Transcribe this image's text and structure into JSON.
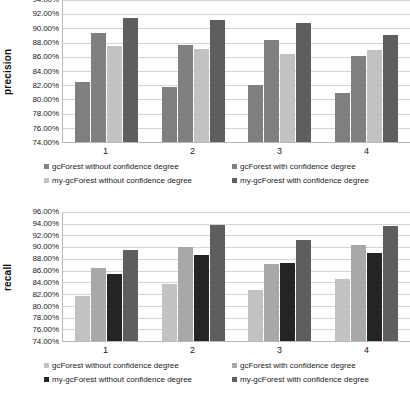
{
  "figure": {
    "charts": [
      {
        "name": "precision-chart",
        "ylabel": "precision",
        "xlabel": "",
        "type": "bar",
        "categories": [
          "1",
          "2",
          "3",
          "4"
        ],
        "ymin": 74.0,
        "ymax": 94.0,
        "ystep": 2.0,
        "yticks": [
          "74.00%",
          "76.00%",
          "78.00%",
          "80.00%",
          "82.00%",
          "84.00%",
          "86.00%",
          "88.00%",
          "90.00%",
          "92.00%",
          "94.00%"
        ],
        "grid": true,
        "legend_position": "bottom",
        "series": [
          {
            "name": "gcForest without confidence degree",
            "color": "#7f7f7f",
            "values": [
              82.4,
              81.8,
              82.1,
              80.9
            ]
          },
          {
            "name": "gcForest with confidence degree",
            "color": "#808080",
            "values": [
              89.4,
              87.6,
              88.4,
              86.1
            ]
          },
          {
            "name": "my-gcForest without confidence degree",
            "color": "#c2c2c2",
            "values": [
              87.5,
              87.1,
              86.4,
              86.9
            ]
          },
          {
            "name": "my-gcForest with confidence degree",
            "color": "#5e5e5e",
            "values": [
              91.5,
              91.2,
              90.7,
              89.1
            ]
          }
        ]
      },
      {
        "name": "recall-chart",
        "ylabel": "recall",
        "xlabel": "",
        "type": "bar",
        "categories": [
          "1",
          "2",
          "3",
          "4"
        ],
        "ymin": 74.0,
        "ymax": 96.0,
        "ystep": 2.0,
        "yticks": [
          "74.00%",
          "76.00%",
          "78.00%",
          "80.00%",
          "82.00%",
          "84.00%",
          "86.00%",
          "88.00%",
          "90.00%",
          "92.00%",
          "94.00%",
          "96.00%"
        ],
        "grid": true,
        "legend_position": "bottom",
        "series": [
          {
            "name": "gcForest without confidence degree",
            "color": "#c2c2c2",
            "values": [
              81.6,
              83.8,
              82.7,
              84.5
            ]
          },
          {
            "name": "gcForest with confidence degree",
            "color": "#a8a8a8",
            "values": [
              86.5,
              90.0,
              87.2,
              90.4
            ]
          },
          {
            "name": "my-gcForest without confidence degree",
            "color": "#242424",
            "values": [
              85.5,
              88.6,
              87.3,
              89.0
            ]
          },
          {
            "name": "my-gcForest with confidence degree",
            "color": "#5e5e5e",
            "values": [
              89.5,
              93.8,
              91.3,
              93.7
            ]
          }
        ]
      }
    ]
  },
  "chart_data": [
    {
      "type": "bar",
      "title": "",
      "xlabel": "",
      "ylabel": "precision",
      "categories": [
        "1",
        "2",
        "3",
        "4"
      ],
      "ylim": [
        74.0,
        96.0
      ],
      "yticks": [
        74.0,
        76.0,
        78.0,
        80.0,
        82.0,
        84.0,
        86.0,
        88.0,
        90.0,
        92.0,
        94.0
      ],
      "ytick_labels": [
        "74.00%",
        "76.00%",
        "78.00%",
        "80.00%",
        "82.00%",
        "84.00%",
        "86.00%",
        "88.00%",
        "90.00%",
        "92.00%",
        "94.00%"
      ],
      "grid": true,
      "legend_position": "bottom",
      "series": [
        {
          "name": "gcForest without confidence degree",
          "values": [
            82.4,
            81.8,
            82.1,
            80.9
          ]
        },
        {
          "name": "gcForest with confidence degree",
          "values": [
            89.4,
            87.6,
            88.4,
            86.1
          ]
        },
        {
          "name": "my-gcForest without confidence degree",
          "values": [
            87.5,
            87.1,
            86.4,
            86.9
          ]
        },
        {
          "name": "my-gcForest with confidence degree",
          "values": [
            91.5,
            91.2,
            90.7,
            89.1
          ]
        }
      ]
    },
    {
      "type": "bar",
      "title": "",
      "xlabel": "",
      "ylabel": "recall",
      "categories": [
        "1",
        "2",
        "3",
        "4"
      ],
      "ylim": [
        74.0,
        96.0
      ],
      "yticks": [
        74.0,
        76.0,
        78.0,
        80.0,
        82.0,
        84.0,
        86.0,
        88.0,
        90.0,
        92.0,
        94.0,
        96.0
      ],
      "ytick_labels": [
        "74.00%",
        "76.00%",
        "78.00%",
        "80.00%",
        "82.00%",
        "84.00%",
        "86.00%",
        "88.00%",
        "90.00%",
        "92.00%",
        "94.00%",
        "96.00%"
      ],
      "grid": true,
      "legend_position": "bottom",
      "series": [
        {
          "name": "gcForest without confidence degree",
          "values": [
            81.6,
            83.8,
            82.7,
            84.5
          ]
        },
        {
          "name": "gcForest with confidence degree",
          "values": [
            86.5,
            90.0,
            87.2,
            90.4
          ]
        },
        {
          "name": "my-gcForest without confidence degree",
          "values": [
            85.5,
            88.6,
            87.3,
            89.0
          ]
        },
        {
          "name": "my-gcForest with confidence degree",
          "values": [
            89.5,
            93.8,
            91.3,
            93.7
          ]
        }
      ]
    }
  ]
}
